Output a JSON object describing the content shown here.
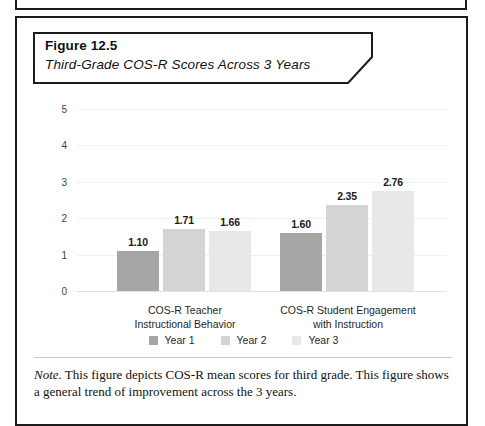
{
  "figure": {
    "number": "Figure 12.5",
    "subtitle": "Third-Grade COS-R Scores Across 3 Years",
    "note_label": "Note.",
    "note_text": " This figure depicts COS-R mean scores for third grade. This figure shows a general trend of improvement across the 3 years."
  },
  "colors": {
    "year1": "#a6a6a6",
    "year2": "#d4d4d4",
    "year3": "#e8e8e8",
    "frame": "#1c1c1c",
    "gridline": "#f0f0f0",
    "axis_text": "#3f3f3f"
  },
  "chart_data": {
    "type": "bar",
    "title": "Third-Grade COS-R Scores Across 3 Years",
    "xlabel": "",
    "ylabel": "",
    "ylim": [
      0,
      5
    ],
    "yticks": [
      0,
      1,
      2,
      3,
      4,
      5
    ],
    "ytick_labels": [
      "0",
      "1",
      "2",
      "3",
      "4",
      "5"
    ],
    "grid": true,
    "legend_position": "bottom",
    "categories": [
      "COS-R Teacher Instructional Behavior",
      "COS-R Student Engagement with Instruction"
    ],
    "category_lines": [
      [
        "COS-R Teacher",
        "Instructional Behavior"
      ],
      [
        "COS-R Student Engagement",
        "with Instruction"
      ]
    ],
    "series": [
      {
        "name": "Year 1",
        "color": "#a6a6a6",
        "values": [
          1.1,
          1.6
        ],
        "labels": [
          "1.10",
          "1.60"
        ]
      },
      {
        "name": "Year 2",
        "color": "#d4d4d4",
        "values": [
          1.71,
          2.35
        ],
        "labels": [
          "1.71",
          "2.35"
        ]
      },
      {
        "name": "Year 3",
        "color": "#e8e8e8",
        "values": [
          1.66,
          2.76
        ],
        "labels": [
          "1.66",
          "2.76"
        ]
      }
    ],
    "bars": [
      {
        "group": 0,
        "series": "Year 1",
        "value": 1.1,
        "label": "1.10",
        "color": "#a6a6a6",
        "x": 80,
        "width": 42
      },
      {
        "group": 0,
        "series": "Year 2",
        "value": 1.71,
        "label": "1.71",
        "color": "#d4d4d4",
        "x": 126,
        "width": 42
      },
      {
        "group": 0,
        "series": "Year 3",
        "value": 1.66,
        "label": "1.66",
        "color": "#e8e8e8",
        "x": 172,
        "width": 42
      },
      {
        "group": 1,
        "series": "Year 1",
        "value": 1.6,
        "label": "1.60",
        "color": "#a6a6a6",
        "x": 243,
        "width": 42
      },
      {
        "group": 1,
        "series": "Year 2",
        "value": 2.35,
        "label": "2.35",
        "color": "#d4d4d4",
        "x": 289,
        "width": 42
      },
      {
        "group": 1,
        "series": "Year 3",
        "value": 2.76,
        "label": "2.76",
        "color": "#e8e8e8",
        "x": 335,
        "width": 42
      }
    ]
  },
  "legend": {
    "items": [
      {
        "label": "Year 1",
        "color": "#a6a6a6"
      },
      {
        "label": "Year 2",
        "color": "#d4d4d4"
      },
      {
        "label": "Year 3",
        "color": "#e8e8e8"
      }
    ]
  }
}
